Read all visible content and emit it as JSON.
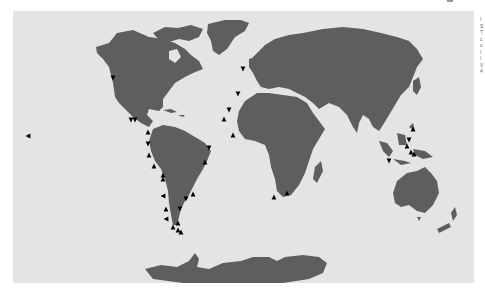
{
  "map": {
    "projection": "world",
    "ocean_color": "#e4e4e4",
    "land_color": "#5e5e5e",
    "marker_color": "#000000",
    "marker_shape": "triangle",
    "markers": [
      {
        "region": "north-america-west-coast",
        "x": 100,
        "y": 67,
        "dir": "down"
      },
      {
        "region": "central-america-pacific",
        "x": 118,
        "y": 109,
        "dir": "down"
      },
      {
        "region": "central-america-pacific",
        "x": 122,
        "y": 109,
        "dir": "down"
      },
      {
        "region": "pacific-open-ocean",
        "x": 15,
        "y": 125,
        "dir": "left"
      },
      {
        "region": "colombia-pacific",
        "x": 135,
        "y": 121,
        "dir": "up"
      },
      {
        "region": "ecuador-pacific",
        "x": 135,
        "y": 133,
        "dir": "down"
      },
      {
        "region": "peru-pacific",
        "x": 136,
        "y": 144,
        "dir": "up"
      },
      {
        "region": "peru-pacific",
        "x": 141,
        "y": 155,
        "dir": "up"
      },
      {
        "region": "chile-north",
        "x": 150,
        "y": 164,
        "dir": "up"
      },
      {
        "region": "chile-north",
        "x": 150,
        "y": 168,
        "dir": "up"
      },
      {
        "region": "chile-central",
        "x": 150,
        "y": 185,
        "dir": "left"
      },
      {
        "region": "chile-central",
        "x": 153,
        "y": 198,
        "dir": "up"
      },
      {
        "region": "chile-south",
        "x": 153,
        "y": 208,
        "dir": "left"
      },
      {
        "region": "argentina-atlantic",
        "x": 167,
        "y": 198,
        "dir": "down"
      },
      {
        "region": "tierra-del-fuego",
        "x": 165,
        "y": 212,
        "dir": "up"
      },
      {
        "region": "tierra-del-fuego",
        "x": 160,
        "y": 216,
        "dir": "up"
      },
      {
        "region": "tierra-del-fuego",
        "x": 165,
        "y": 219,
        "dir": "up"
      },
      {
        "region": "tierra-del-fuego",
        "x": 168,
        "y": 221,
        "dir": "up"
      },
      {
        "region": "uruguay-atlantic",
        "x": 180,
        "y": 183,
        "dir": "up"
      },
      {
        "region": "argentina-atlantic",
        "x": 173,
        "y": 188,
        "dir": "down"
      },
      {
        "region": "brazil-northeast",
        "x": 196,
        "y": 137,
        "dir": "down"
      },
      {
        "region": "brazil-east",
        "x": 192,
        "y": 151,
        "dir": "up"
      },
      {
        "region": "ireland-uk",
        "x": 230,
        "y": 58,
        "dir": "down"
      },
      {
        "region": "morocco-atlantic",
        "x": 225,
        "y": 83,
        "dir": "down"
      },
      {
        "region": "western-sahara",
        "x": 216,
        "y": 99,
        "dir": "down"
      },
      {
        "region": "cape-verde",
        "x": 211,
        "y": 108,
        "dir": "up"
      },
      {
        "region": "gulf-of-guinea",
        "x": 220,
        "y": 124,
        "dir": "up"
      },
      {
        "region": "south-africa-west",
        "x": 261,
        "y": 186,
        "dir": "up"
      },
      {
        "region": "south-africa-east",
        "x": 274,
        "y": 182,
        "dir": "up"
      },
      {
        "region": "philippines",
        "x": 400,
        "y": 118,
        "dir": "up"
      },
      {
        "region": "indonesia-sulawesi",
        "x": 396,
        "y": 129,
        "dir": "down"
      },
      {
        "region": "indonesia-maluku",
        "x": 394,
        "y": 135,
        "dir": "up"
      },
      {
        "region": "indonesia-maluku",
        "x": 398,
        "y": 141,
        "dir": "up"
      },
      {
        "region": "indonesia-maluku",
        "x": 401,
        "y": 143,
        "dir": "up"
      },
      {
        "region": "indonesia-java",
        "x": 376,
        "y": 150,
        "dir": "down"
      }
    ]
  },
  "side_text": {
    "visible": true,
    "lines": [
      "I",
      "S",
      "T",
      "c",
      "c",
      "I",
      "I",
      "V",
      "4"
    ]
  }
}
